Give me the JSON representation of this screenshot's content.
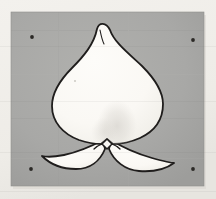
{
  "image": {
    "title": "Scanned ink drawing of a spade-leaf emblem",
    "subject": "leaf-spade-symbol",
    "medium": "ink line drawing on paper, photographed",
    "caption": "A symmetrical spade- or lotus-leaf shaped figure outlined in dark ink, filled pale cream, centered on a flat grey rectangular panel with four small registration dots near the corners."
  },
  "canvas": {
    "width": 216,
    "height": 199,
    "paper_color": "#f0eeea",
    "paper_edge_shadow": "#d9d6d0"
  },
  "panel": {
    "name": "grey-backdrop-panel",
    "x": 11,
    "y": 12,
    "width": 193,
    "height": 174,
    "fill_color": "#a8a8a6",
    "fill_color_light": "#b0b0ad",
    "fill_color_dark": "#9d9d9b",
    "edge_color": "#8f8f8d"
  },
  "figure": {
    "name": "leaf-spade-figure",
    "fill_color": "#fbfaf6",
    "fill_shadow_color": "#cdcac4",
    "outline_color": "#1f1d1c",
    "outline_width": 1.8,
    "apex": {
      "x": 97,
      "y": 29
    },
    "widest_left": {
      "x": 52,
      "y": 104
    },
    "widest_right": {
      "x": 163,
      "y": 104
    },
    "left_wing_tip": {
      "x": 42,
      "y": 156
    },
    "right_wing_tip": {
      "x": 174,
      "y": 163
    },
    "center_notch": {
      "x": 107,
      "y": 145
    },
    "bounding_box": {
      "x": 41,
      "y": 28,
      "width": 135,
      "height": 138
    }
  },
  "center_ornament": {
    "name": "center-diamond-notch",
    "cx": 107,
    "cy": 144,
    "radius": 5,
    "fill_color": "#f7f5f1",
    "outline_color": "#1f1d1c"
  },
  "registration_marks": [
    {
      "label": "top-left-dot",
      "cx": 32,
      "cy": 37,
      "r": 1.9,
      "color": "#2b2926"
    },
    {
      "label": "top-right-dot",
      "cx": 193,
      "cy": 40,
      "r": 1.9,
      "color": "#2b2926"
    },
    {
      "label": "bottom-left-dot",
      "cx": 31,
      "cy": 169,
      "r": 1.9,
      "color": "#2b2926"
    },
    {
      "label": "bottom-right-dot",
      "cx": 193,
      "cy": 169,
      "r": 1.9,
      "color": "#2b2926"
    }
  ],
  "interior_shading": {
    "name": "interior-smudge",
    "cx": 117,
    "cy": 126,
    "rx": 20,
    "ry": 26,
    "color": "#d4d1cb",
    "opacity": 0.55
  }
}
